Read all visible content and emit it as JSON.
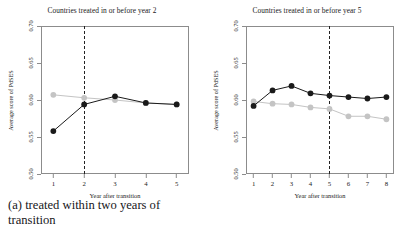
{
  "figure": {
    "axis_label_y": "Average score of PdSES",
    "axis_label_x": "Year after transition"
  },
  "panels": [
    {
      "id": "panel-a",
      "title": "Countries treated in or before year 2",
      "caption": "(a) treated within two years of transition",
      "vline_label": "2"
    },
    {
      "id": "panel-b",
      "title": "Countries treated in or before year 5",
      "caption": "(b) treated within five years of transition",
      "vline_label": "5"
    }
  ],
  "colors": {
    "treated": "#1a1a1a",
    "control": "#c4c4c4",
    "frame": "#8c8c8c",
    "vline": "#222222",
    "background": "#ffffff"
  },
  "chart_data": [
    {
      "type": "line",
      "title": "Countries treated in or before year 2",
      "xlabel": "Year after transition",
      "ylabel": "Average score of PdSES",
      "x": [
        1,
        2,
        3,
        4,
        5
      ],
      "xlim": [
        0.6,
        5.4
      ],
      "ylim": [
        0.5,
        0.7
      ],
      "yticks": [
        0.5,
        0.55,
        0.6,
        0.65,
        0.7
      ],
      "ytick_labels": [
        "0.50",
        "0.55",
        "0.60",
        "0.65",
        "0.70"
      ],
      "xticks": [
        1,
        2,
        3,
        4,
        5
      ],
      "xtick_labels": [
        "1",
        "2",
        "3",
        "4",
        "5"
      ],
      "grid": false,
      "legend": "none",
      "annotations": [
        {
          "type": "vline",
          "x": 2,
          "style": "dashed"
        }
      ],
      "series": [
        {
          "name": "treated",
          "color": "#1a1a1a",
          "marker": "filled-circle",
          "values": [
            0.558,
            0.594,
            0.605,
            0.596,
            0.594
          ]
        },
        {
          "name": "control",
          "color": "#c4c4c4",
          "marker": "filled-circle",
          "values": [
            0.607,
            0.603,
            0.6,
            0.596,
            0.594
          ]
        }
      ]
    },
    {
      "type": "line",
      "title": "Countries treated in or before year 5",
      "xlabel": "Year after transition",
      "ylabel": "Average score of PdSES",
      "x": [
        1,
        2,
        3,
        4,
        5,
        6,
        7,
        8
      ],
      "xlim": [
        0.6,
        8.4
      ],
      "ylim": [
        0.5,
        0.7
      ],
      "yticks": [
        0.5,
        0.55,
        0.6,
        0.65,
        0.7
      ],
      "ytick_labels": [
        "0.50",
        "0.55",
        "0.60",
        "0.65",
        "0.70"
      ],
      "xticks": [
        1,
        2,
        3,
        4,
        5,
        6,
        7,
        8
      ],
      "xtick_labels": [
        "1",
        "2",
        "3",
        "4",
        "5",
        "6",
        "7",
        "8"
      ],
      "grid": false,
      "legend": "none",
      "annotations": [
        {
          "type": "vline",
          "x": 5,
          "style": "dashed"
        }
      ],
      "series": [
        {
          "name": "treated",
          "color": "#1a1a1a",
          "marker": "filled-circle",
          "values": [
            0.592,
            0.613,
            0.619,
            0.609,
            0.606,
            0.604,
            0.602,
            0.604
          ]
        },
        {
          "name": "control",
          "color": "#c4c4c4",
          "marker": "filled-circle",
          "values": [
            0.598,
            0.595,
            0.594,
            0.59,
            0.588,
            0.578,
            0.578,
            0.574
          ]
        }
      ]
    }
  ]
}
